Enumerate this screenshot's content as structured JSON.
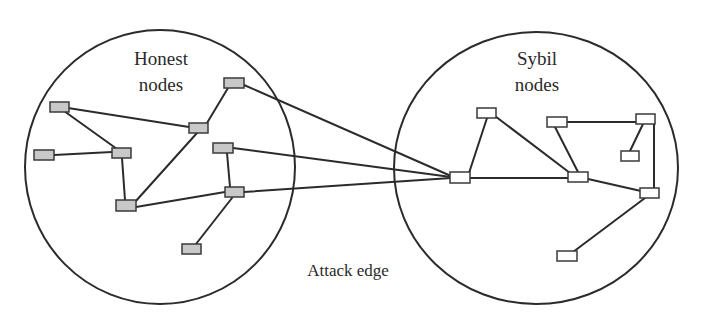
{
  "diagram": {
    "type": "network-graph",
    "regions": [
      {
        "id": "honest",
        "label_line1": "Honest",
        "label_line2": "nodes",
        "node_fill": "#c8c8c8"
      },
      {
        "id": "sybil",
        "label_line1": "Sybil",
        "label_line2": "nodes",
        "node_fill": "#ffffff"
      }
    ],
    "edge_label": "Attack edge",
    "honest_nodes": [
      "H1",
      "H2",
      "H3",
      "H4",
      "H5",
      "H6",
      "H7",
      "H8",
      "H9"
    ],
    "sybil_nodes": [
      "S1",
      "S2",
      "S3",
      "S4",
      "S5",
      "S6",
      "S7",
      "S8"
    ],
    "honest_edges": [
      [
        "H1",
        "H3"
      ],
      [
        "H1",
        "H4"
      ],
      [
        "H2",
        "H3"
      ],
      [
        "H3",
        "H8"
      ],
      [
        "H8",
        "H4"
      ],
      [
        "H4",
        "H5"
      ],
      [
        "H8",
        "H7"
      ],
      [
        "H6",
        "H7"
      ],
      [
        "H7",
        "H9"
      ]
    ],
    "sybil_edges": [
      [
        "S5",
        "S1"
      ],
      [
        "S1",
        "S6"
      ],
      [
        "S5",
        "S6"
      ],
      [
        "S2",
        "S6"
      ],
      [
        "S2",
        "S3"
      ],
      [
        "S3",
        "S4"
      ],
      [
        "S3",
        "S7"
      ],
      [
        "S6",
        "S7"
      ],
      [
        "S7",
        "S8"
      ]
    ],
    "attack_edges": [
      [
        "H5",
        "S5"
      ],
      [
        "H6",
        "S5"
      ],
      [
        "H7",
        "S5"
      ]
    ]
  }
}
